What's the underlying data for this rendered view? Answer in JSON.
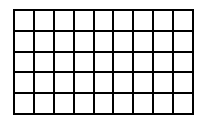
{
  "grid": {
    "rows": 5,
    "columns": 9,
    "line_color": "#000000",
    "cell_color": "#ffffff"
  }
}
